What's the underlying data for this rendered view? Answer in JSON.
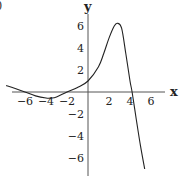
{
  "chart_data": {
    "type": "line",
    "title": "",
    "panel_marker": ")",
    "xlabel": "x",
    "ylabel": "y",
    "xlim": [
      -7.5,
      7
    ],
    "ylim": [
      -7,
      7
    ],
    "grid": false,
    "x_ticks": [
      -6,
      -4,
      -2,
      2,
      4,
      6
    ],
    "y_ticks": [
      6,
      4,
      2,
      -2,
      -4,
      -6
    ],
    "x_tick_labels": [
      "−6",
      "−4",
      "−2",
      "2",
      "4",
      "6"
    ],
    "y_tick_labels": [
      "6",
      "4",
      "2",
      "−2",
      "−4",
      "−6"
    ],
    "series": [
      {
        "name": "f(x)",
        "x": [
          -7.8,
          -7,
          -6,
          -5,
          -4,
          -3.5,
          -3,
          -2,
          -1,
          0,
          1,
          1.5,
          2,
          2.5,
          2.8,
          3.2,
          3.6,
          4,
          4.2,
          4.6,
          5,
          5.4
        ],
        "y": [
          0.6,
          0.35,
          0.0,
          -0.35,
          -0.55,
          -0.55,
          -0.45,
          0.0,
          0.4,
          1.0,
          2.3,
          3.5,
          4.9,
          6.0,
          6.25,
          5.8,
          3.5,
          1.0,
          0.0,
          -2.5,
          -4.9,
          -7.0
        ]
      }
    ],
    "color": "#222222"
  }
}
